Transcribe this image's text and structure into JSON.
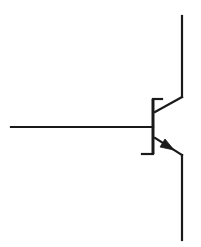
{
  "diagram": {
    "type": "circuit-symbol",
    "component": "NPN bipolar junction transistor",
    "title": "",
    "colors": {
      "line": "#1a1a1a",
      "background": "#ffffff"
    },
    "terminals": [
      {
        "name": "base",
        "label": ""
      },
      {
        "name": "collector",
        "label": ""
      },
      {
        "name": "emitter",
        "label": ""
      }
    ],
    "geometry": {
      "base_lead": {
        "x1": 11,
        "y1": 127,
        "x2": 153,
        "y2": 127
      },
      "base_bar": {
        "x": 153,
        "y1": 99,
        "y2": 154
      },
      "base_bar_top_serif": {
        "x1": 153,
        "y1": 99,
        "x2": 162,
        "y2": 99
      },
      "base_bar_bottom_serif": {
        "x1": 142,
        "y1": 154,
        "x2": 153,
        "y2": 154
      },
      "collector_diagonal": {
        "x1": 155,
        "y1": 112,
        "x2": 182,
        "y2": 97
      },
      "collector_lead": {
        "x1": 182,
        "y1": 97,
        "x2": 182,
        "y2": 16
      },
      "emitter_diagonal": {
        "x1": 155,
        "y1": 138,
        "x2": 182,
        "y2": 155
      },
      "emitter_lead": {
        "x1": 182,
        "y1": 155,
        "x2": 182,
        "y2": 240
      },
      "emitter_arrow": {
        "tip_x": 173,
        "tip_y": 150,
        "direction": "outward"
      }
    }
  }
}
